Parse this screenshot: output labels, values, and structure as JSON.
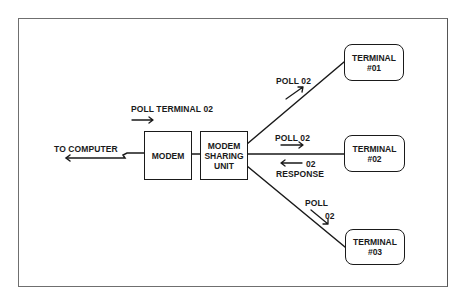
{
  "diagram": {
    "type": "block-diagram",
    "title": "",
    "nodes": [
      {
        "id": "modem",
        "label": "MODEM",
        "shape": "rectangle"
      },
      {
        "id": "msu",
        "label_lines": [
          "MODEM",
          "SHARING",
          "UNIT"
        ],
        "shape": "rectangle"
      },
      {
        "id": "t1",
        "label_lines": [
          "TERMINAL",
          "#01"
        ],
        "shape": "rounded-rectangle"
      },
      {
        "id": "t2",
        "label_lines": [
          "TERMINAL",
          "#02"
        ],
        "shape": "rounded-rectangle"
      },
      {
        "id": "t3",
        "label_lines": [
          "TERMINAL",
          "#03"
        ],
        "shape": "rounded-rectangle"
      }
    ],
    "edges": [
      {
        "from": "modem",
        "to": "computer",
        "label": "TO COMPUTER",
        "style": "lightning-break-with-arrow"
      },
      {
        "from": "modem",
        "to": "msu"
      },
      {
        "from": "msu",
        "to": "t1"
      },
      {
        "from": "msu",
        "to": "t2"
      },
      {
        "from": "msu",
        "to": "t3"
      }
    ],
    "annotations": [
      {
        "text": "POLL TERMINAL 02",
        "arrow": "right",
        "near": "modem"
      },
      {
        "text": "POLL 02",
        "arrow": "up-right",
        "near": "msu-t1"
      },
      {
        "text": "POLL 02",
        "arrow": "right",
        "near": "msu-t2"
      },
      {
        "text": "02",
        "arrow": "left",
        "near": "msu-t2"
      },
      {
        "text": "RESPONSE",
        "near": "msu-t2"
      },
      {
        "text": "POLL",
        "near": "msu-t3"
      },
      {
        "text": "02",
        "arrow": "down-right",
        "near": "msu-t3"
      }
    ]
  },
  "labels": {
    "to_computer": "TO COMPUTER",
    "poll_terminal_02": "POLL TERMINAL 02",
    "poll_02_t1": "POLL 02",
    "poll_02_t2": "POLL 02",
    "response_02": "02",
    "response": "RESPONSE",
    "poll_t3": "POLL",
    "poll_t3_num": "02"
  },
  "boxes": {
    "modem": "MODEM",
    "msu": {
      "line1": "MODEM",
      "line2": "SHARING",
      "line3": "UNIT"
    },
    "t1": {
      "line1": "TERMINAL",
      "line2": "#01"
    },
    "t2": {
      "line1": "TERMINAL",
      "line2": "#02"
    },
    "t3": {
      "line1": "TERMINAL",
      "line2": "#03"
    }
  },
  "colors": {
    "ink": "#1a1a1a",
    "frame": "#6f6f6f",
    "background": "#ffffff"
  }
}
